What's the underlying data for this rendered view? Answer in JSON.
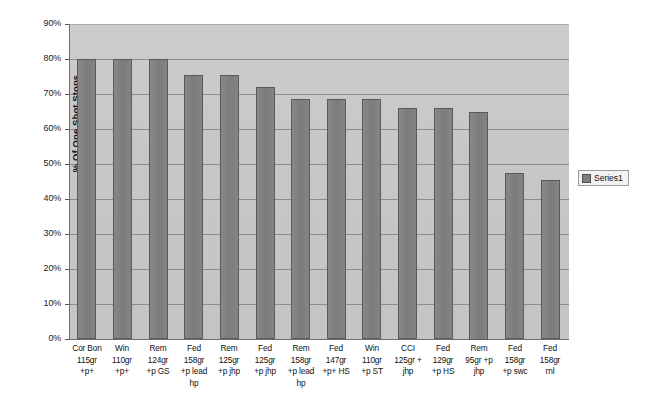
{
  "chart_data": {
    "type": "bar",
    "title": "",
    "xlabel": "",
    "ylabel": "% Of One Shot Stops",
    "ylim": [
      0,
      90
    ],
    "ytick_step": 10,
    "grid": true,
    "legend_position": "right",
    "legend_entries": [
      "Series1"
    ],
    "categories": [
      "Cor Bon 115gr +p+",
      "Win 110gr +p+",
      "Rem 124gr +p GS",
      "Fed 158gr +p lead hp",
      "Rem 125gr +p jhp",
      "Fed 125gr +p jhp",
      "Rem 158gr +p lead hp",
      "Fed 147gr +p+ HS",
      "Win 110gr +p ST",
      "CCI 125gr + jhp",
      "Fed 129gr +p HS",
      "Rem 95gr +p jhp",
      "Fed 158gr +p swc",
      "Fed 158gr rnl"
    ],
    "category_lines": [
      [
        "Cor Bon",
        "115gr",
        "+p+"
      ],
      [
        "Win",
        "110gr",
        "+p+"
      ],
      [
        "Rem",
        "124gr",
        "+p GS"
      ],
      [
        "Fed",
        "158gr",
        "+p lead",
        "hp"
      ],
      [
        "Rem",
        "125gr",
        "+p jhp"
      ],
      [
        "Fed",
        "125gr",
        "+p jhp"
      ],
      [
        "Rem",
        "158gr",
        "+p lead",
        "hp"
      ],
      [
        "Fed",
        "147gr",
        "+p+ HS"
      ],
      [
        "Win",
        "110gr",
        "+p ST"
      ],
      [
        "CCI",
        "125gr +",
        "jhp"
      ],
      [
        "Fed",
        "129gr",
        "+p HS"
      ],
      [
        "Rem",
        "95gr +p",
        "jhp"
      ],
      [
        "Fed",
        "158gr",
        "+p swc"
      ],
      [
        "Fed",
        "158gr",
        "rnl"
      ]
    ],
    "values": [
      80,
      80,
      80,
      75.5,
      75.5,
      72,
      68.5,
      68.5,
      68.5,
      66,
      66,
      65,
      47.5,
      45.5
    ],
    "ytick_labels": [
      "90%",
      "80%",
      "70%",
      "60%",
      "50%",
      "40%",
      "30%",
      "20%",
      "10%",
      "0%"
    ],
    "ytick_values": [
      90,
      80,
      70,
      60,
      50,
      40,
      30,
      20,
      10,
      0
    ],
    "series": [
      {
        "name": "Series1",
        "color": "#7e7e7e",
        "values": [
          80,
          80,
          80,
          75.5,
          75.5,
          72,
          68.5,
          68.5,
          68.5,
          66,
          66,
          65,
          47.5,
          45.5
        ]
      }
    ]
  },
  "colors": {
    "plot_background": "#c9c9c9",
    "bar_fill": "#7e7e7e",
    "bar_outline": "#5a5a5a",
    "gridline": "#8c8c8c",
    "axis": "#6e6e6e",
    "page_background": "#ffffff"
  }
}
